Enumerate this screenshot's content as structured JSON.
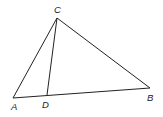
{
  "diagram": {
    "type": "triangle-with-cevian",
    "points": {
      "A": {
        "x": 13,
        "y": 98,
        "label": "A",
        "label_x": 11,
        "label_y": 110
      },
      "B": {
        "x": 150,
        "y": 88,
        "label": "B",
        "label_x": 147,
        "label_y": 101
      },
      "C": {
        "x": 57,
        "y": 18,
        "label": "C",
        "label_x": 54,
        "label_y": 13
      },
      "D": {
        "x": 47,
        "y": 95,
        "label": "D",
        "label_x": 42,
        "label_y": 108
      }
    },
    "segments": [
      {
        "from": "A",
        "to": "C"
      },
      {
        "from": "C",
        "to": "B"
      },
      {
        "from": "A",
        "to": "B"
      },
      {
        "from": "C",
        "to": "D"
      }
    ],
    "stroke_color": "#222222"
  }
}
